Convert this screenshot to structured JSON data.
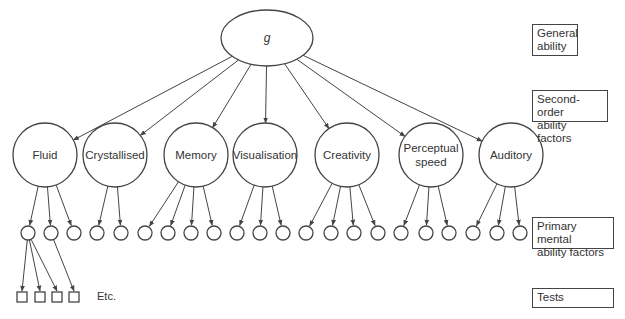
{
  "diagram": {
    "root": {
      "label": "g",
      "cx": 267,
      "cy": 38,
      "rx": 46,
      "ry": 28
    },
    "second_order": [
      {
        "lines": [
          "Fluid"
        ],
        "cx": 45,
        "cy": 155
      },
      {
        "lines": [
          "Crystallised"
        ],
        "cx": 115,
        "cy": 155
      },
      {
        "lines": [
          "Memory"
        ],
        "cx": 196,
        "cy": 155
      },
      {
        "lines": [
          "Visualisation"
        ],
        "cx": 265,
        "cy": 155
      },
      {
        "lines": [
          "Creativity"
        ],
        "cx": 347,
        "cy": 155
      },
      {
        "lines": [
          "Perceptual",
          "speed"
        ],
        "cx": 431,
        "cy": 155
      },
      {
        "lines": [
          "Auditory"
        ],
        "cx": 511,
        "cy": 155
      }
    ],
    "second_order_radius": 32,
    "primary": {
      "cy": 233,
      "r": 7,
      "groups": [
        {
          "parent": 0,
          "xs": [
            28,
            51,
            74
          ]
        },
        {
          "parent": 1,
          "xs": [
            97,
            121
          ]
        },
        {
          "parent": 2,
          "xs": [
            145,
            168,
            191,
            214
          ]
        },
        {
          "parent": 3,
          "xs": [
            237,
            260,
            283
          ]
        },
        {
          "parent": 4,
          "xs": [
            306,
            331,
            354,
            378
          ]
        },
        {
          "parent": 5,
          "xs": [
            401,
            426,
            449
          ]
        },
        {
          "parent": 6,
          "xs": [
            473,
            497,
            520
          ]
        }
      ]
    },
    "tests": {
      "y": 292,
      "size": 10,
      "squares": [
        {
          "x": 17,
          "from": 28
        },
        {
          "x": 35,
          "from": 28
        },
        {
          "x": 52,
          "from": 28
        },
        {
          "x": 69,
          "from": 51
        }
      ],
      "etc_label": "Etc.",
      "etc_x": 97,
      "etc_y": 300
    },
    "stroke_color": "#444444"
  },
  "levels": [
    {
      "lines": [
        "General",
        "ability"
      ],
      "top": 24,
      "left": 532,
      "width": 46,
      "height": 32
    },
    {
      "lines": [
        "Second-order",
        "ability factors"
      ],
      "top": 90,
      "left": 532,
      "width": 76,
      "height": 32
    },
    {
      "lines": [
        "Primary mental",
        "ability factors"
      ],
      "top": 217,
      "left": 532,
      "width": 82,
      "height": 32
    },
    {
      "lines": [
        "Tests"
      ],
      "top": 288,
      "left": 532,
      "width": 82,
      "height": 20
    }
  ]
}
